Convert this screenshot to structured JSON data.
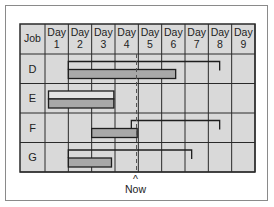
{
  "chart": {
    "header_job_label": "Job",
    "days": [
      {
        "line1": "Day",
        "line2": "1"
      },
      {
        "line1": "Day",
        "line2": "2"
      },
      {
        "line1": "Day",
        "line2": "3"
      },
      {
        "line1": "Day",
        "line2": "4"
      },
      {
        "line1": "Day",
        "line2": "5"
      },
      {
        "line1": "Day",
        "line2": "6"
      },
      {
        "line1": "Day",
        "line2": "7"
      },
      {
        "line1": "Day",
        "line2": "8"
      },
      {
        "line1": "Day",
        "line2": "9"
      }
    ],
    "jobs": [
      {
        "name": "D",
        "planned_start": 2,
        "planned_end": 9,
        "actual_start": 2,
        "actual_end": 6.6,
        "style": "bracket"
      },
      {
        "name": "E",
        "planned_start": 1.15,
        "planned_end": 3.95,
        "actual_start": 1.15,
        "actual_end": 3.95,
        "style": "box"
      },
      {
        "name": "F",
        "planned_start": 4.7,
        "planned_end": 9,
        "actual_start": 3,
        "actual_end": 4.95,
        "style": "bracket"
      },
      {
        "name": "G",
        "planned_start": 2,
        "planned_end": 7.8,
        "actual_start": 2,
        "actual_end": 3.85,
        "style": "bracket"
      }
    ],
    "now_marker": {
      "label": "Now",
      "caret": "^",
      "day_position": 4.9
    },
    "colors": {
      "grid_fill": "#d9d9d9",
      "grid_line": "#2a2a2a",
      "bar_fill": "#a8a8a8",
      "outline": "#1e1e1e",
      "frame_border": "#8a8a8a",
      "text": "#222222"
    }
  }
}
